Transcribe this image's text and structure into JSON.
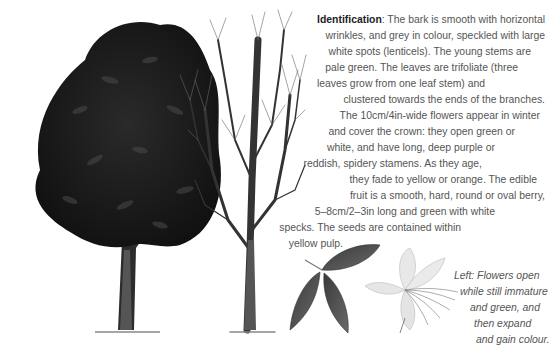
{
  "identification": {
    "heading": "Identification",
    "lines": [
      ": The bark is smooth with horizontal",
      "wrinkles, and grey in colour, speckled with large",
      "white spots (lenticels). The young stems are",
      "pale green. The leaves are trifoliate (three",
      "leaves grow from one leaf stem) and",
      "clustered towards the ends of the branches.",
      "The 10cm/4in-wide flowers appear in winter",
      "and cover the crown: they open green or",
      "white, and have long, deep purple or",
      "reddish, spidery stamens. As they age,",
      "they fade to yellow or orange. The edible",
      "fruit is a smooth, hard, round or oval berry,",
      "5–8cm/2–3in long and green with white",
      "specks. The seeds are contained within",
      "yellow pulp."
    ]
  },
  "caption": {
    "lines": [
      "Left: Flowers open",
      "while still immature",
      "and green, and",
      "then expand",
      "and gain colour."
    ]
  },
  "illustrations": {
    "tree_in_leaf": "Tree in full leaf",
    "tree_in_winter": "Bare winter tree",
    "leaf": "Trifoliate leaf",
    "flower": "Flower with spidery stamens"
  }
}
